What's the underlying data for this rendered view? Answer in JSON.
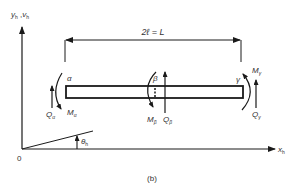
{
  "figure": {
    "caption": "(b)",
    "y_axis_label": "y",
    "y_axis_sub": "h",
    "y_axis_label2": "v",
    "y_axis_sub2": "h",
    "y_axis_sep": " ,",
    "x_axis_label": "x",
    "x_axis_sub": "h",
    "origin_label": "0",
    "angle_label": "θ",
    "angle_sub": "h",
    "dimension_label": "2ℓ = L",
    "points": {
      "alpha": "α",
      "beta": "β",
      "gamma": "γ"
    },
    "forces": {
      "Q_alpha": {
        "main": "Q",
        "sub": "α"
      },
      "M_alpha": {
        "main": "M",
        "sub": "α"
      },
      "M_beta": {
        "main": "M",
        "sub": "β"
      },
      "Q_beta": {
        "main": "Q",
        "sub": "β"
      },
      "M_gamma": {
        "main": "M",
        "sub": "γ"
      },
      "Q_gamma": {
        "main": "Q",
        "sub": "γ"
      }
    },
    "colors": {
      "line": "#1a1a1a",
      "text": "#333333",
      "background": "#ffffff"
    }
  }
}
